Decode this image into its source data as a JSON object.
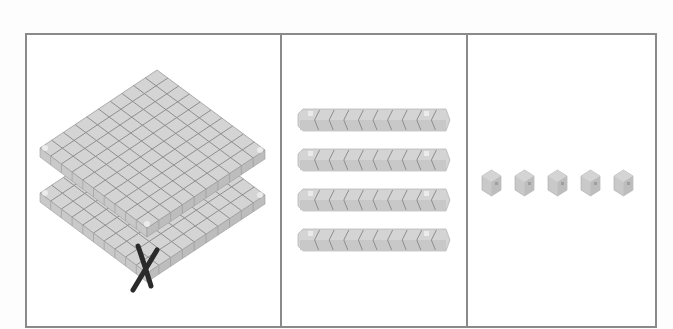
{
  "figure": {
    "panels": [
      {
        "id": "hundreds",
        "label": "Hundreds",
        "block_type": "flat",
        "count": 2,
        "crossed_out": 1,
        "crossed_out_mark": "X"
      },
      {
        "id": "tens",
        "label": "Tens",
        "block_type": "rod",
        "count": 4,
        "units_per_block": 10
      },
      {
        "id": "ones",
        "label": "Ones",
        "block_type": "unit-cube",
        "count": 5
      }
    ],
    "colors": {
      "border": "#8a8a8a",
      "block_top": "#d4d4d4",
      "block_side": "#bdbdbd",
      "block_front": "#c9c9c9",
      "grid_line": "#8f8f8f",
      "highlight": "#f0f0f0",
      "cross_mark": "#2a2a2a"
    }
  }
}
